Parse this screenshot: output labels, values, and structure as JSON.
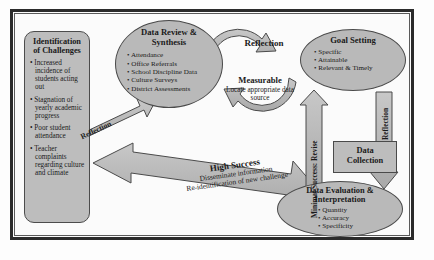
{
  "diagram": {
    "colors": {
      "shape_fill": "#b9b9b9",
      "shape_stroke": "#4a4a4a",
      "frame": "#2b2b2b",
      "page_background": "#fdfdfd"
    }
  },
  "challenges": {
    "header_line1": "Identification",
    "header_line2": "of Challenges",
    "items": [
      "Increased incidence of students acting out",
      "Stagnation of yearly academic progress",
      "Poor student attendance",
      "Teacher complaints regarding culture and climate"
    ]
  },
  "data_review": {
    "header_line1": "Data Review &",
    "header_line2": "Synthesis",
    "items": [
      "Attendance",
      "Office Referrals",
      "School Discipline Data",
      "Culture Surveys",
      "District Assessments"
    ]
  },
  "goal_setting": {
    "header": "Goal Setting",
    "items": [
      "Specific",
      "Attainable",
      "Relevant & Timely"
    ]
  },
  "data_collection": {
    "line1": "Data",
    "line2": "Collection"
  },
  "data_evaluation": {
    "header_line1": "Data Evaluation &",
    "header_line2": "Interpretation",
    "items": [
      "Quantity",
      "Accuracy",
      "Specificity"
    ]
  },
  "center_loop": {
    "reflection_label": "Reflection",
    "measurable_title": "Measurable",
    "measurable_subtitle": "Locate appropriate data source"
  },
  "arrow_labels": {
    "minimal_success": "Minimal Success: Revise",
    "reflection_right": "Reflection",
    "reflection_diagonal": "Reflection",
    "high_success_title": "High Success",
    "high_success_line1": "Disseminate information",
    "high_success_line2": "Re-identification of new challenge"
  }
}
